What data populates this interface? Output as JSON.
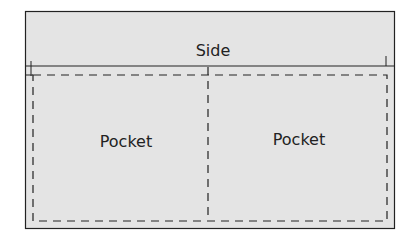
{
  "diagram": {
    "side_label": "Side",
    "pocket_left_label": "Pocket",
    "pocket_right_label": "Pocket",
    "colors": {
      "fill": "#e4e4e4",
      "stroke": "#222222"
    }
  }
}
